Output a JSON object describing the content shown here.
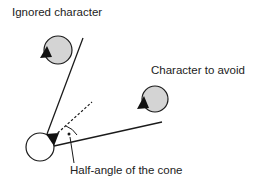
{
  "labels": {
    "ignored": "Ignored character",
    "avoid": "Character to avoid",
    "half_angle": "Half-angle of the cone"
  },
  "colors": {
    "character_fill": "#d4d4d4",
    "agent_fill": "#ffffff",
    "stroke": "#1a1a1a"
  }
}
